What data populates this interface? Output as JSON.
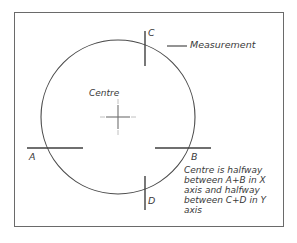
{
  "figure": {
    "type": "technical-diagram",
    "background_color": "#ffffff",
    "line_color": "#4a4a4a",
    "frame_color": "#6a6a6a",
    "text_color": "#3a3a3a",
    "crosshair_color": "#9a9a9a"
  },
  "labels": {
    "c": "C",
    "d": "D",
    "a": "A",
    "b": "B",
    "centre": "Centre",
    "measurement": "Measurement"
  },
  "note": {
    "line1": "Centre is halfway",
    "line2": "between A+B in X",
    "line3": "axis and halfway",
    "line4": "between C+D in Y",
    "line5": "axis"
  },
  "geometry": {
    "circle": {
      "cx": 118,
      "cy": 117,
      "r": 77
    },
    "centre_mark": {
      "x": 118,
      "y": 117
    },
    "tick_a": {
      "x1": 27,
      "y1": 148,
      "x2": 83,
      "y2": 148
    },
    "tick_b": {
      "x1": 155,
      "y1": 148,
      "x2": 211,
      "y2": 148
    },
    "tick_c": {
      "x1": 145,
      "y1": 31,
      "x2": 145,
      "y2": 66
    },
    "tick_d": {
      "x1": 145,
      "y1": 176,
      "x2": 145,
      "y2": 210
    },
    "leader_line": {
      "x1": 167,
      "y1": 46,
      "x2": 187,
      "y2": 46
    },
    "frame": {
      "x": 14,
      "y": 12,
      "width": 270,
      "height": 215
    }
  }
}
